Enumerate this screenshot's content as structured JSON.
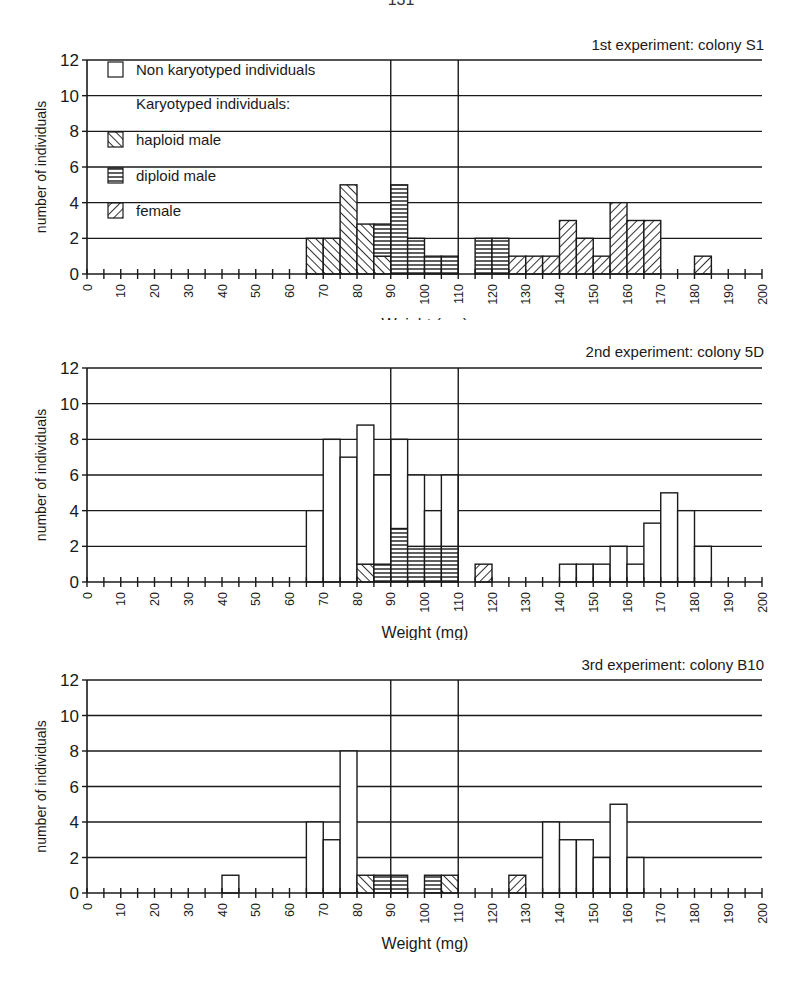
{
  "page": {
    "header_fragment": "131"
  },
  "legend": {
    "items": [
      {
        "key": "non",
        "label": "Non karyotyped individuals"
      },
      {
        "key": "",
        "label": "Karyotyped individuals:"
      },
      {
        "key": "hap",
        "label": "haploid male"
      },
      {
        "key": "dip",
        "label": "diploid male"
      },
      {
        "key": "fem",
        "label": "female"
      }
    ]
  },
  "chart_data": [
    {
      "type": "bar",
      "stacked": true,
      "title": "1st experiment: colony S1",
      "xlabel": "Weight (mg)",
      "ylabel": "number of individuals",
      "xlim": [
        0,
        200
      ],
      "ylim": [
        0,
        12
      ],
      "yticks": [
        0,
        2,
        4,
        6,
        8,
        10,
        12
      ],
      "xticks": [
        0,
        10,
        20,
        30,
        40,
        50,
        60,
        70,
        80,
        90,
        100,
        110,
        120,
        130,
        140,
        150,
        160,
        170,
        180,
        190,
        200
      ],
      "bin_width": 5,
      "reference_lines_x": [
        90,
        110
      ],
      "legend_position": "upper-left",
      "grid": true,
      "bins": [
        {
          "x": 65,
          "hap": 2
        },
        {
          "x": 70,
          "hap": 2
        },
        {
          "x": 75,
          "hap": 5
        },
        {
          "x": 80,
          "hap": 2.8
        },
        {
          "x": 85,
          "hap": 1,
          "dip": 1.8
        },
        {
          "x": 90,
          "dip": 5
        },
        {
          "x": 95,
          "dip": 2
        },
        {
          "x": 100,
          "dip": 1
        },
        {
          "x": 105,
          "dip": 1
        },
        {
          "x": 115,
          "dip": 2
        },
        {
          "x": 120,
          "dip": 2
        },
        {
          "x": 125,
          "fem": 1
        },
        {
          "x": 130,
          "fem": 1
        },
        {
          "x": 135,
          "fem": 1
        },
        {
          "x": 140,
          "fem": 3
        },
        {
          "x": 145,
          "fem": 2
        },
        {
          "x": 150,
          "fem": 1
        },
        {
          "x": 155,
          "fem": 4
        },
        {
          "x": 160,
          "fem": 3
        },
        {
          "x": 165,
          "fem": 3
        },
        {
          "x": 180,
          "fem": 1
        }
      ]
    },
    {
      "type": "bar",
      "stacked": true,
      "title": "2nd experiment: colony 5D",
      "xlabel": "Weight (mg)",
      "ylabel": "number of individuals",
      "xlim": [
        0,
        200
      ],
      "ylim": [
        0,
        12
      ],
      "yticks": [
        0,
        2,
        4,
        6,
        8,
        10,
        12
      ],
      "xticks": [
        0,
        10,
        20,
        30,
        40,
        50,
        60,
        70,
        80,
        90,
        100,
        110,
        120,
        130,
        140,
        150,
        160,
        170,
        180,
        190,
        200
      ],
      "bin_width": 5,
      "reference_lines_x": [
        90,
        110
      ],
      "grid": true,
      "bins": [
        {
          "x": 65,
          "non": 4
        },
        {
          "x": 70,
          "non": 8
        },
        {
          "x": 75,
          "non": 7
        },
        {
          "x": 80,
          "hap": 1,
          "non": 7.8
        },
        {
          "x": 85,
          "dip": 1,
          "non": 5
        },
        {
          "x": 90,
          "dip": 3,
          "non": 5
        },
        {
          "x": 95,
          "dip": 2,
          "non": 4
        },
        {
          "x": 100,
          "dip": 2,
          "non": 2
        },
        {
          "x": 105,
          "dip": 2,
          "non": 4
        },
        {
          "x": 115,
          "fem": 1
        },
        {
          "x": 140,
          "non": 1
        },
        {
          "x": 145,
          "non": 1
        },
        {
          "x": 150,
          "non": 1
        },
        {
          "x": 155,
          "non": 2
        },
        {
          "x": 160,
          "non": 1
        },
        {
          "x": 165,
          "non": 3.3
        },
        {
          "x": 170,
          "non": 5
        },
        {
          "x": 175,
          "non": 4
        },
        {
          "x": 180,
          "non": 2
        }
      ]
    },
    {
      "type": "bar",
      "stacked": true,
      "title": "3rd experiment: colony B10",
      "xlabel": "Weight (mg)",
      "ylabel": "number of individuals",
      "xlim": [
        0,
        200
      ],
      "ylim": [
        0,
        12
      ],
      "yticks": [
        0,
        2,
        4,
        6,
        8,
        10,
        12
      ],
      "xticks": [
        0,
        10,
        20,
        30,
        40,
        50,
        60,
        70,
        80,
        90,
        100,
        110,
        120,
        130,
        140,
        150,
        160,
        170,
        180,
        190,
        200
      ],
      "bin_width": 5,
      "reference_lines_x": [
        90,
        110
      ],
      "grid": true,
      "bins": [
        {
          "x": 40,
          "non": 1
        },
        {
          "x": 65,
          "non": 4
        },
        {
          "x": 70,
          "non": 3
        },
        {
          "x": 75,
          "non": 8
        },
        {
          "x": 80,
          "hap": 1
        },
        {
          "x": 85,
          "dip": 1
        },
        {
          "x": 90,
          "dip": 1
        },
        {
          "x": 100,
          "dip": 1
        },
        {
          "x": 105,
          "hap": 1
        },
        {
          "x": 125,
          "fem": 1
        },
        {
          "x": 135,
          "non": 4
        },
        {
          "x": 140,
          "non": 3
        },
        {
          "x": 145,
          "non": 3
        },
        {
          "x": 150,
          "non": 2
        },
        {
          "x": 155,
          "non": 5
        },
        {
          "x": 160,
          "non": 2
        }
      ]
    }
  ]
}
